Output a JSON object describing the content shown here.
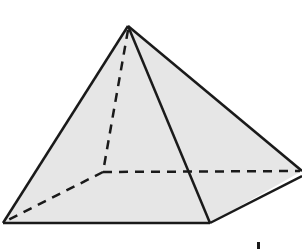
{
  "diagram": {
    "type": "square pyramid",
    "colors": {
      "fill": "#e6e6e6",
      "edge": "#1a1a1a",
      "background": "#ffffff"
    },
    "vertices": {
      "apex": [
        128,
        26
      ],
      "front_left": [
        3,
        223
      ],
      "front_right": [
        210,
        223
      ],
      "back_right": [
        302,
        171
      ],
      "back_left_hidden": [
        103,
        172
      ]
    },
    "visible_edges": [
      [
        "apex",
        "front_left"
      ],
      [
        "apex",
        "front_right"
      ],
      [
        "apex",
        "back_right"
      ],
      [
        "front_left",
        "front_right"
      ],
      [
        "front_right",
        "back_right"
      ]
    ],
    "hidden_edges": [
      [
        "apex",
        "back_left_hidden"
      ],
      [
        "back_left_hidden",
        "front_left"
      ],
      [
        "back_left_hidden",
        "back_right"
      ]
    ]
  }
}
